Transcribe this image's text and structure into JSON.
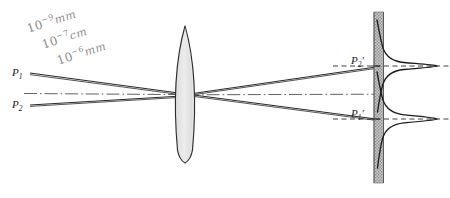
{
  "figure": {
    "background_color": "#ffffff",
    "ink_color": "#1c1c1c",
    "pencil_color": "#8d8d8d",
    "lens_fill_color": "#e2e2e2",
    "screen_fill_color": "#b4b4b4"
  },
  "object_labels": {
    "p1": "P",
    "p1_sub": "1",
    "p2": "P",
    "p2_sub": "2"
  },
  "image_labels": {
    "p2_prime": "P",
    "p2_prime_sub": "2",
    "p2_prime_mark": "′",
    "p1_prime": "P",
    "p1_prime_sub": "1",
    "p1_prime_mark": "′"
  },
  "annotations": [
    {
      "base": "10",
      "exponent": "−9",
      "unit": "mm"
    },
    {
      "base": "10",
      "exponent": "−7",
      "unit": "cm"
    },
    {
      "base": "10",
      "exponent": "−6",
      "unit": "mm"
    }
  ],
  "elements": {
    "lens_name": "biconvex-lens",
    "screen_name": "image-screen",
    "axis_name": "optical-axis",
    "curve_name": "diffraction-intensity-curve"
  },
  "geometry": {
    "lens_center_x": 185,
    "lens_top_y": 26,
    "lens_bottom_y": 163,
    "axis_y": 93,
    "screen_left_x": 374,
    "screen_right_x": 383,
    "screen_top_y": 12,
    "screen_bottom_y": 183,
    "p1_y": 73,
    "p2_y": 105,
    "p2_prime_y": 66,
    "p1_prime_y": 119,
    "peak_x": 437
  }
}
